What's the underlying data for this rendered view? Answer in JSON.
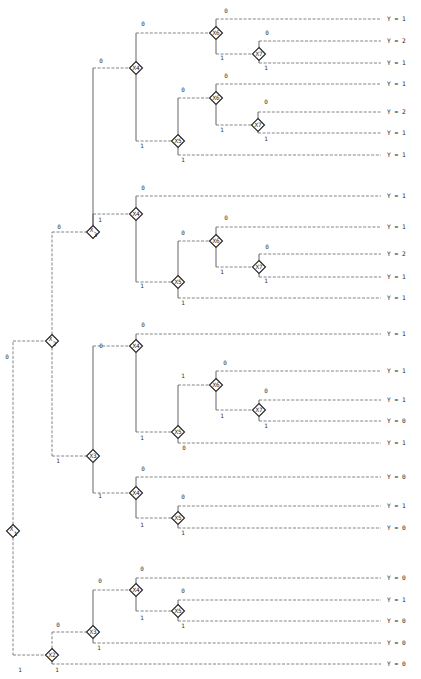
{
  "diagram": {
    "type": "decision-tree",
    "orientation": "left-to-right",
    "node_size": 13,
    "colors": {
      "line": "#666666",
      "node_border": "#222222",
      "text": "#222222",
      "background": "#ffffff"
    },
    "nodes": [
      {
        "id": "n1",
        "label": "X",
        "sub": "1",
        "x": 13,
        "y": 531
      },
      {
        "id": "n2a",
        "label": "X",
        "sub": "2",
        "x": 52,
        "y": 341
      },
      {
        "id": "n2b",
        "label": "X2",
        "sub": "",
        "x": 52,
        "y": 655
      },
      {
        "id": "n3a",
        "label": "X",
        "sub": "3",
        "x": 93,
        "y": 232
      },
      {
        "id": "n3b",
        "label": "X3",
        "sub": "",
        "x": 93,
        "y": 456
      },
      {
        "id": "n3c",
        "label": "X3",
        "sub": "",
        "x": 93,
        "y": 632
      },
      {
        "id": "n4a",
        "label": "X4",
        "sub": "",
        "x": 136,
        "y": 68
      },
      {
        "id": "n4b",
        "label": "X4",
        "sub": "",
        "x": 136,
        "y": 214
      },
      {
        "id": "n4c",
        "label": "X4",
        "sub": "",
        "x": 136,
        "y": 346
      },
      {
        "id": "n4d",
        "label": "X4",
        "sub": "",
        "x": 136,
        "y": 493
      },
      {
        "id": "n4e",
        "label": "X4",
        "sub": "",
        "x": 136,
        "y": 590
      },
      {
        "id": "n5a",
        "label": "X5",
        "sub": "",
        "x": 178,
        "y": 141
      },
      {
        "id": "n5b",
        "label": "X5",
        "sub": "",
        "x": 178,
        "y": 282
      },
      {
        "id": "n5c",
        "label": "X5",
        "sub": "",
        "x": 178,
        "y": 432
      },
      {
        "id": "n5d",
        "label": "X5",
        "sub": "",
        "x": 178,
        "y": 518
      },
      {
        "id": "n5e",
        "label": "X5",
        "sub": "",
        "x": 178,
        "y": 611
      },
      {
        "id": "n6a",
        "label": "X6",
        "sub": "",
        "x": 216,
        "y": 33
      },
      {
        "id": "n6b",
        "label": "X6",
        "sub": "",
        "x": 216,
        "y": 98
      },
      {
        "id": "n6c",
        "label": "X6",
        "sub": "",
        "x": 216,
        "y": 241
      },
      {
        "id": "n6d",
        "label": "X6",
        "sub": "",
        "x": 216,
        "y": 385
      },
      {
        "id": "n7a",
        "label": "X7",
        "sub": "",
        "x": 259,
        "y": 54
      },
      {
        "id": "n7b",
        "label": "X7",
        "sub": "",
        "x": 258,
        "y": 125
      },
      {
        "id": "n7c",
        "label": "X7",
        "sub": "",
        "x": 259,
        "y": 267
      },
      {
        "id": "n7d",
        "label": "X7",
        "sub": "",
        "x": 259,
        "y": 410
      }
    ],
    "edges": [
      {
        "from": "n1",
        "to": "n2a",
        "branch": "0",
        "side": "up",
        "style": "dash",
        "lx": 7,
        "ly": 359
      },
      {
        "from": "n1",
        "to": "n2b",
        "branch": "1",
        "side": "down",
        "style": "dash",
        "lx": 20,
        "ly": 672
      },
      {
        "from": "n2a",
        "to": "n3a",
        "branch": "0",
        "side": "up",
        "style": "dash",
        "lx": 59,
        "ly": 229
      },
      {
        "from": "n2a",
        "to": "n3b",
        "branch": "1",
        "side": "down",
        "style": "dash",
        "lx": 58,
        "ly": 463
      },
      {
        "from": "n2b",
        "to": "n3c",
        "branch": "0",
        "side": "up",
        "style": "dash",
        "lx": 58,
        "ly": 627
      },
      {
        "from": "n3a",
        "to": "n4a",
        "branch": "0",
        "side": "up",
        "style": "solid",
        "lx": 101,
        "ly": 63
      },
      {
        "from": "n3a",
        "to": "n4b",
        "branch": "1",
        "side": "down",
        "style": "solid",
        "lx": 100,
        "ly": 222
      },
      {
        "from": "n3b",
        "to": "n4c",
        "branch": "0",
        "side": "up",
        "style": "solid",
        "lx": 101,
        "ly": 348
      },
      {
        "from": "n3b",
        "to": "n4d",
        "branch": "1",
        "side": "down",
        "style": "solid",
        "lx": 100,
        "ly": 498
      },
      {
        "from": "n3c",
        "to": "n4e",
        "branch": "0",
        "side": "up",
        "style": "solid",
        "lx": 100,
        "ly": 583
      },
      {
        "from": "n4a",
        "to": "n5a",
        "branch": "1",
        "side": "down",
        "style": "solid",
        "lx": 142,
        "ly": 148
      },
      {
        "from": "n4a",
        "to": "n6a",
        "branch": "0",
        "side": "up",
        "style": "solid",
        "lx": 143,
        "ly": 26
      },
      {
        "from": "n4b",
        "to": "n5b",
        "branch": "1",
        "side": "down",
        "style": "solid",
        "lx": 142,
        "ly": 288
      },
      {
        "from": "n4c",
        "to": "n5c",
        "branch": "1",
        "side": "down",
        "style": "solid",
        "lx": 142,
        "ly": 440
      },
      {
        "from": "n4d",
        "to": "n5d",
        "branch": "1",
        "side": "down",
        "style": "solid",
        "lx": 142,
        "ly": 527
      },
      {
        "from": "n4e",
        "to": "n5e",
        "branch": "1",
        "side": "down",
        "style": "solid",
        "lx": 142,
        "ly": 620
      },
      {
        "from": "n5a",
        "to": "n6b",
        "branch": "0",
        "side": "up",
        "style": "solid",
        "lx": 183,
        "ly": 92
      },
      {
        "from": "n5b",
        "to": "n6c",
        "branch": "0",
        "side": "up",
        "style": "solid",
        "lx": 183,
        "ly": 235
      },
      {
        "from": "n5c",
        "to": "n6d",
        "branch": "1",
        "side": "up",
        "style": "solid",
        "lx": 183,
        "ly": 378
      },
      {
        "from": "n6a",
        "to": "n7a",
        "branch": "1",
        "side": "down",
        "style": "solid",
        "lx": 222,
        "ly": 60
      },
      {
        "from": "n6b",
        "to": "n7b",
        "branch": "1",
        "side": "down",
        "style": "solid",
        "lx": 222,
        "ly": 132
      },
      {
        "from": "n6c",
        "to": "n7c",
        "branch": "1",
        "side": "down",
        "style": "solid",
        "lx": 222,
        "ly": 274
      },
      {
        "from": "n6d",
        "to": "n7d",
        "branch": "1",
        "side": "down",
        "style": "solid",
        "lx": 222,
        "ly": 418
      }
    ],
    "leaves": [
      {
        "from": "n6a",
        "branch": "0",
        "side": "top",
        "y": 19,
        "value": "Y = 1",
        "lx": 226,
        "ly": 13
      },
      {
        "from": "n7a",
        "branch": "0",
        "side": "top",
        "y": 41,
        "value": "Y = 2",
        "lx": 267,
        "ly": 35
      },
      {
        "from": "n7a",
        "branch": "1",
        "side": "bottom",
        "y": 63,
        "value": "Y = 1",
        "lx": 266,
        "ly": 70
      },
      {
        "from": "n6b",
        "branch": "0",
        "side": "top",
        "y": 84,
        "value": "Y = 1",
        "lx": 226,
        "ly": 78
      },
      {
        "from": "n7b",
        "branch": "0",
        "side": "top",
        "y": 112,
        "value": "Y = 2",
        "lx": 266,
        "ly": 104
      },
      {
        "from": "n7b",
        "branch": "1",
        "side": "bottom",
        "y": 133,
        "value": "Y = 1",
        "lx": 266,
        "ly": 141
      },
      {
        "from": "n5a",
        "branch": "1",
        "side": "bottom",
        "y": 155,
        "value": "Y = 1",
        "lx": 183,
        "ly": 162
      },
      {
        "from": "n4b",
        "branch": "0",
        "side": "top",
        "y": 196,
        "value": "Y = 1",
        "lx": 143,
        "ly": 190
      },
      {
        "from": "n6c",
        "branch": "0",
        "side": "top",
        "y": 227,
        "value": "Y = 1",
        "lx": 226,
        "ly": 220
      },
      {
        "from": "n7c",
        "branch": "0",
        "side": "top",
        "y": 254,
        "value": "Y = 2",
        "lx": 267,
        "ly": 249
      },
      {
        "from": "n7c",
        "branch": "1",
        "side": "bottom",
        "y": 277,
        "value": "Y = 1",
        "lx": 266,
        "ly": 283
      },
      {
        "from": "n5b",
        "branch": "1",
        "side": "bottom",
        "y": 298,
        "value": "Y = 1",
        "lx": 183,
        "ly": 305
      },
      {
        "from": "n4c",
        "branch": "0",
        "side": "top",
        "y": 334,
        "value": "Y = 1",
        "lx": 143,
        "ly": 327
      },
      {
        "from": "n6d",
        "branch": "0",
        "side": "top",
        "y": 371,
        "value": "Y = 1",
        "lx": 225,
        "ly": 365
      },
      {
        "from": "n7d",
        "branch": "0",
        "side": "top",
        "y": 400,
        "value": "Y = 1",
        "lx": 266,
        "ly": 393
      },
      {
        "from": "n7d",
        "branch": "1",
        "side": "bottom",
        "y": 421,
        "value": "Y = 0",
        "lx": 266,
        "ly": 428
      },
      {
        "from": "n5c",
        "branch": "0",
        "side": "bottom",
        "y": 443,
        "value": "Y = 1",
        "lx": 184,
        "ly": 450
      },
      {
        "from": "n4d",
        "branch": "0",
        "side": "top",
        "y": 477,
        "value": "Y = 0",
        "lx": 143,
        "ly": 471
      },
      {
        "from": "n5d",
        "branch": "0",
        "side": "top",
        "y": 506,
        "value": "Y = 1",
        "lx": 183,
        "ly": 499
      },
      {
        "from": "n5d",
        "branch": "1",
        "side": "bottom",
        "y": 528,
        "value": "Y = 0",
        "lx": 183,
        "ly": 535
      },
      {
        "from": "n4e",
        "branch": "0",
        "side": "top",
        "y": 578,
        "value": "Y = 0",
        "lx": 142,
        "ly": 571
      },
      {
        "from": "n5e",
        "branch": "0",
        "side": "top",
        "y": 600,
        "value": "Y = 1",
        "lx": 183,
        "ly": 593
      },
      {
        "from": "n5e",
        "branch": "1",
        "side": "bottom",
        "y": 621,
        "value": "Y = 0",
        "lx": 183,
        "ly": 628
      },
      {
        "from": "n3c",
        "branch": "1",
        "side": "bottom",
        "y": 643,
        "value": "Y = 0",
        "lx": 99,
        "ly": 650
      },
      {
        "from": "n2b",
        "branch": "1",
        "side": "bottom",
        "y": 664,
        "value": "Y = 0",
        "lx": 57,
        "ly": 672
      }
    ],
    "leaf_line_end_x": 381,
    "leaf_label_x": 387
  }
}
